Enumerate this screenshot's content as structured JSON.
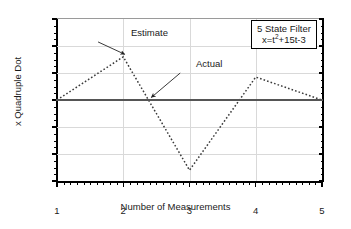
{
  "chart_data": {
    "type": "line",
    "title": "",
    "xlabel": "Number of Measurements",
    "ylabel": "x Quadruple Dot",
    "xlim": [
      1,
      5
    ],
    "ylim": [
      -6,
      6
    ],
    "xticks": [
      1,
      2,
      3,
      4,
      5
    ],
    "yticks": [
      -6,
      -4,
      -2,
      0,
      2,
      4,
      6
    ],
    "xtick_labels": [
      "1",
      "2",
      "3",
      "4",
      "5"
    ],
    "ytick_labels": [
      "-6",
      "-4",
      "-2",
      "0",
      "2",
      "4",
      "6"
    ],
    "x_minor_ticks_per_interval": 10,
    "y_minor_ticks_per_interval": 4,
    "grid": true,
    "grid_color": "#d9d9d9",
    "legend_position": "top-right-inside",
    "series": [
      {
        "name": "Estimate",
        "style": "dotted",
        "color": "#3a3a3a",
        "x": [
          1,
          2,
          3,
          4,
          5
        ],
        "values": [
          0.0,
          3.2,
          -5.2,
          1.7,
          0.0
        ]
      },
      {
        "name": "Actual",
        "style": "solid",
        "color": "#555555",
        "x": [
          1,
          5
        ],
        "values": [
          0.0,
          0.0
        ]
      }
    ],
    "annotations": [
      {
        "label": "Estimate",
        "text_x": 1.62,
        "text_y": 4.85,
        "point_x": 2.0,
        "point_y": 3.2
      },
      {
        "label": "Actual",
        "text_x": 2.86,
        "text_y": 2.55,
        "point_x": 2.4,
        "point_y": 0.0
      }
    ],
    "textbox": {
      "line1": "5 State Filter",
      "line2_prefix": "x=t",
      "line2_exponent": "2",
      "line2_suffix": "+15t-3",
      "line2_plain": "x=t^2+15t-3",
      "border_color": "#000000",
      "background": "#ffffff"
    }
  }
}
